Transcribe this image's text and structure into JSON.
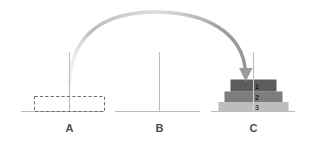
{
  "diagram": {
    "background_color": "#ffffff",
    "baseline_color": "#b9b9b9",
    "peg_color": "#b9b9b9",
    "arrow_color": "#9a9a9a",
    "label_color": "#4d4d4d",
    "pegs": [
      {
        "id": "A",
        "label": "A",
        "x": 69,
        "state": "empty-placeholder",
        "disks": []
      },
      {
        "id": "B",
        "label": "B",
        "x": 159,
        "state": "empty",
        "disks": []
      },
      {
        "id": "C",
        "label": "C",
        "x": 253,
        "state": "stacked",
        "disks": [
          {
            "label": "1",
            "size": 1,
            "color": "#5d5d5d",
            "width": 46,
            "label_style": "dark"
          },
          {
            "label": "2",
            "size": 2,
            "color": "#7d7d7d",
            "width": 58,
            "label_style": "dark"
          },
          {
            "label": "3",
            "size": 3,
            "color": "#bdbdbd",
            "width": 70,
            "label_style": "light"
          }
        ]
      }
    ],
    "placeholder": {
      "peg": "A",
      "style": "dashed",
      "stroke_color": "#6b6b6b",
      "width": 70,
      "height": 15
    },
    "arrow": {
      "from_peg": "A",
      "to_peg": "C",
      "shape": "arc",
      "direction": "down",
      "color_start": "#c9c9c9",
      "color_end": "#9a9a9a",
      "arrowhead": "triangle-down"
    }
  }
}
